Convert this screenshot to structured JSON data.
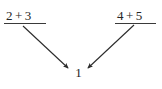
{
  "figure": {
    "background_color": "#ffffff",
    "ink_color": "#262626",
    "width": 162,
    "height": 89
  },
  "expressions": {
    "left": {
      "full_text": "2 + 3",
      "operand_a": "2",
      "operator": "+",
      "operand_b": "3",
      "underlined": true
    },
    "right": {
      "full_text": "4 + 5",
      "operand_a": "4",
      "operator": "+",
      "operand_b": "5",
      "underlined": true
    }
  },
  "result": {
    "value": "1"
  },
  "arrows": [
    {
      "name": "arrow-left-to-result",
      "from": "left expression",
      "to": "result",
      "direction": "down-right",
      "head": "filled-triangle"
    },
    {
      "name": "arrow-right-to-result",
      "from": "right expression",
      "to": "result",
      "direction": "down-left",
      "head": "filled-triangle"
    }
  ]
}
